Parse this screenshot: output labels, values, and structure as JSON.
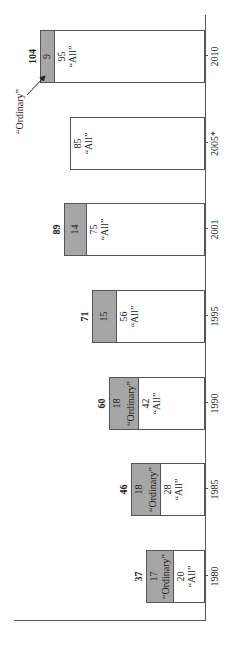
{
  "chart_data": {
    "type": "bar",
    "stacked": true,
    "orientation": "rotated-90-ccw",
    "categories": [
      "1980",
      "1985",
      "1990",
      "1995",
      "2001",
      "2005*",
      "2010"
    ],
    "series": [
      {
        "name": "“All”",
        "values": [
          20,
          28,
          42,
          56,
          75,
          85,
          95
        ],
        "color": "#ffffff"
      },
      {
        "name": "“Ordinary”",
        "values": [
          17,
          18,
          18,
          15,
          14,
          null,
          9
        ],
        "color": "#a6a6a6"
      }
    ],
    "totals": [
      37,
      46,
      60,
      71,
      89,
      null,
      104
    ],
    "title": "",
    "xlabel": "",
    "ylabel": "",
    "grid": false,
    "legend": "none (inline labels)",
    "annotations": [
      {
        "text": "“Ordinary”",
        "target": "2010",
        "type": "arrow"
      }
    ]
  },
  "labels": {
    "all": "“All”",
    "ordinary": "“Ordinary”"
  }
}
